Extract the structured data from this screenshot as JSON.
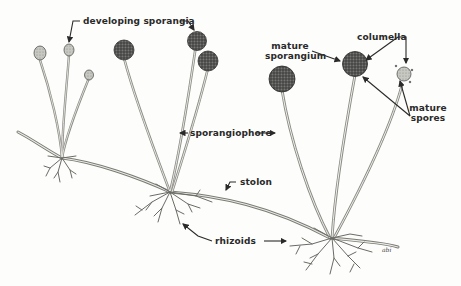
{
  "diagram": {
    "labels": {
      "developing_sporangia": "developing sporangia",
      "sporangiophore": "sporangiophore",
      "stolon": "stolon",
      "rhizoids": "rhizoids",
      "mature_sporangium_line1": "mature",
      "mature_sporangium_line2": "sporangium",
      "columella": "columella",
      "mature_spores_line1": "mature",
      "mature_spores_line2": "spores"
    },
    "signature": "abi",
    "colors": {
      "background": "#fdfdfb",
      "ink": "#2a2a2a",
      "sporangium_dark": "#4a4a4a",
      "sporangium_light": "#bdbdb6",
      "stalk": "#8a8a86"
    }
  }
}
